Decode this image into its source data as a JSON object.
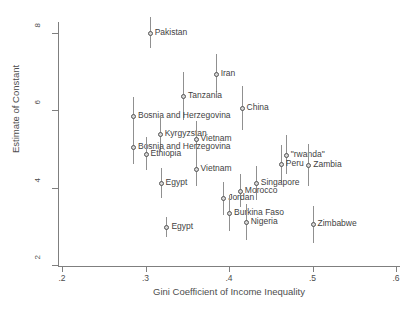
{
  "chart_data": {
    "type": "scatter",
    "title": "",
    "xlabel": "Gini Coefficient of Income Inequality",
    "ylabel": "Estimate of Constant",
    "xlim": [
      0.2,
      0.6
    ],
    "ylim": [
      2,
      8.4
    ],
    "xticks": [
      ".2",
      ".3",
      ".4",
      ".5",
      ".6"
    ],
    "xtick_values": [
      0.2,
      0.3,
      0.4,
      0.5,
      0.6
    ],
    "yticks": [
      "2",
      "4",
      "6",
      "8"
    ],
    "ytick_values": [
      2,
      4,
      6,
      8
    ],
    "grid": false,
    "legend": null,
    "error_bars": "vertical confidence intervals",
    "points": [
      {
        "label": "Pakistan",
        "x": 0.305,
        "y": 8.0,
        "lo": 7.6,
        "hi": 8.42,
        "label_side": "right"
      },
      {
        "label": "Iran",
        "x": 0.384,
        "y": 6.95,
        "lo": 6.45,
        "hi": 7.45,
        "label_side": "right"
      },
      {
        "label": "Tanzania",
        "x": 0.345,
        "y": 6.38,
        "lo": 5.75,
        "hi": 7.0,
        "label_side": "right"
      },
      {
        "label": "China",
        "x": 0.415,
        "y": 6.05,
        "lo": 5.48,
        "hi": 6.62,
        "label_side": "right"
      },
      {
        "label": "Bosnia and Herzegovina",
        "x": 0.285,
        "y": 5.85,
        "lo": 5.35,
        "hi": 6.35,
        "label_side": "right"
      },
      {
        "label": "Kyrgyzstan",
        "x": 0.317,
        "y": 5.4,
        "lo": 4.95,
        "hi": 5.85,
        "label_side": "right"
      },
      {
        "label": "Vietnam",
        "x": 0.36,
        "y": 5.25,
        "lo": 4.78,
        "hi": 5.72,
        "label_side": "right"
      },
      {
        "label": "Bosnia and Herzegovina",
        "x": 0.285,
        "y": 5.05,
        "lo": 4.62,
        "hi": 5.48,
        "label_side": "right"
      },
      {
        "label": "Ethiopia",
        "x": 0.3,
        "y": 4.88,
        "lo": 4.45,
        "hi": 5.3,
        "label_side": "right"
      },
      {
        "label": "\"rwanda\"",
        "x": 0.468,
        "y": 4.85,
        "lo": 4.35,
        "hi": 5.35,
        "label_side": "right"
      },
      {
        "label": "Peru",
        "x": 0.462,
        "y": 4.62,
        "lo": 4.15,
        "hi": 5.1,
        "label_side": "right"
      },
      {
        "label": "Zambia",
        "x": 0.495,
        "y": 4.58,
        "lo": 4.05,
        "hi": 5.12,
        "label_side": "right"
      },
      {
        "label": "Vietnam",
        "x": 0.36,
        "y": 4.48,
        "lo": 4.05,
        "hi": 4.92,
        "label_side": "right"
      },
      {
        "label": "Singapore",
        "x": 0.432,
        "y": 4.12,
        "lo": 3.68,
        "hi": 4.56,
        "label_side": "right"
      },
      {
        "label": "Egypt",
        "x": 0.318,
        "y": 4.12,
        "lo": 3.72,
        "hi": 4.52,
        "label_side": "right"
      },
      {
        "label": "Morocco",
        "x": 0.413,
        "y": 3.92,
        "lo": 3.5,
        "hi": 4.35,
        "label_side": "right"
      },
      {
        "label": "Jordan",
        "x": 0.393,
        "y": 3.72,
        "lo": 3.3,
        "hi": 4.15,
        "label_side": "right"
      },
      {
        "label": "Burkina Faso",
        "x": 0.4,
        "y": 3.35,
        "lo": 2.88,
        "hi": 3.82,
        "label_side": "right"
      },
      {
        "label": "Nigeria",
        "x": 0.42,
        "y": 3.12,
        "lo": 2.65,
        "hi": 3.58,
        "label_side": "right"
      },
      {
        "label": "Zimbabwe",
        "x": 0.5,
        "y": 3.05,
        "lo": 2.58,
        "hi": 3.52,
        "label_side": "right"
      },
      {
        "label": "Egypt",
        "x": 0.325,
        "y": 2.98,
        "lo": 2.72,
        "hi": 3.25,
        "label_side": "right"
      }
    ]
  },
  "footnote": ""
}
